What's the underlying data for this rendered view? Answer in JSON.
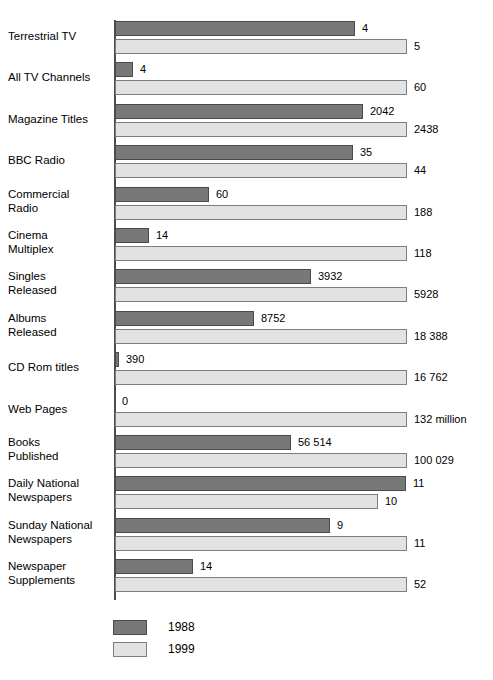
{
  "chart_data": {
    "type": "bar",
    "orientation": "horizontal",
    "title": "",
    "subtitle": "",
    "xlabel": "",
    "ylabel": "",
    "grid": false,
    "legend_position": "bottom-left",
    "axis_note": "Bar lengths are not to a common linear scale; each row is scaled independently. Value labels are printed at the end of each bar.",
    "categories": [
      "Terrestrial TV",
      "All TV Channels",
      "Magazine Titles",
      "BBC Radio",
      "Commercial\nRadio",
      "Cinema\nMultiplex",
      "Singles\nReleased",
      "Albums\nReleased",
      "CD Rom titles",
      "Web Pages",
      "Books\nPublished",
      "Daily National\nNewspapers",
      "Sunday National\nNewspapers",
      "Newspaper\nSupplements"
    ],
    "series": [
      {
        "name": "1988",
        "color": "#787878",
        "values": [
          4,
          4,
          2042,
          35,
          60,
          14,
          3932,
          8752,
          390,
          0,
          56514,
          11,
          9,
          14
        ],
        "labels": [
          "4",
          "4",
          "2042",
          "35",
          "60",
          "14",
          "3932",
          "8752",
          "390",
          "0",
          "56 514",
          "11",
          "9",
          "14"
        ],
        "bar_px": [
          240,
          18,
          248,
          238,
          94,
          34,
          196,
          139,
          4,
          0,
          176,
          291,
          215,
          78
        ]
      },
      {
        "name": "1999",
        "color": "#e2e2e2",
        "values": [
          5,
          60,
          2438,
          44,
          188,
          118,
          5928,
          18388,
          16762,
          132000000,
          100029,
          10,
          11,
          52
        ],
        "labels": [
          "5",
          "60",
          "2438",
          "44",
          "188",
          "118",
          "5928",
          "18 388",
          "16 762",
          "132 million",
          "100 029",
          "10",
          "11",
          "52"
        ],
        "bar_px": [
          292,
          292,
          292,
          292,
          292,
          292,
          292,
          292,
          292,
          292,
          292,
          263,
          292,
          292
        ]
      }
    ]
  },
  "legend": {
    "items": [
      {
        "label": "1988",
        "color": "#787878"
      },
      {
        "label": "1999",
        "color": "#e2e2e2"
      }
    ]
  }
}
